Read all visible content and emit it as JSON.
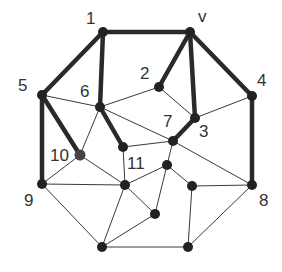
{
  "diagram": {
    "type": "graph",
    "colors": {
      "edge": "#3a3a3a",
      "highlight": "#2a2a2a",
      "node": "#222222",
      "label": "#333333"
    },
    "nodes": [
      {
        "id": "1",
        "x": 103,
        "y": 32,
        "label": "1",
        "lx": 86,
        "ly": 24
      },
      {
        "id": "v",
        "x": 190,
        "y": 32,
        "label": "v",
        "lx": 198,
        "ly": 22
      },
      {
        "id": "5",
        "x": 42,
        "y": 95,
        "label": "5",
        "lx": 18,
        "ly": 91
      },
      {
        "id": "6",
        "x": 100,
        "y": 107,
        "label": "6",
        "lx": 80,
        "ly": 97
      },
      {
        "id": "2",
        "x": 159,
        "y": 87,
        "label": "2",
        "lx": 140,
        "ly": 79
      },
      {
        "id": "4",
        "x": 252,
        "y": 96,
        "label": "4",
        "lx": 257,
        "ly": 86
      },
      {
        "id": "3",
        "x": 195,
        "y": 118,
        "label": "3",
        "lx": 199,
        "ly": 137
      },
      {
        "id": "7",
        "x": 173,
        "y": 141,
        "label": "7",
        "lx": 163,
        "ly": 127
      },
      {
        "id": "10",
        "x": 80,
        "y": 155,
        "label": "10",
        "lx": 50,
        "ly": 161
      },
      {
        "id": "11",
        "x": 123,
        "y": 147,
        "label": "11",
        "lx": 127,
        "ly": 169
      },
      {
        "id": "9",
        "x": 42,
        "y": 184,
        "label": "9",
        "lx": 24,
        "ly": 206
      },
      {
        "id": "a",
        "x": 125,
        "y": 185,
        "label": "",
        "lx": 0,
        "ly": 0
      },
      {
        "id": "b",
        "x": 167,
        "y": 165,
        "label": "",
        "lx": 0,
        "ly": 0
      },
      {
        "id": "c",
        "x": 192,
        "y": 186,
        "label": "",
        "lx": 0,
        "ly": 0
      },
      {
        "id": "8",
        "x": 252,
        "y": 185,
        "label": "8",
        "lx": 259,
        "ly": 206
      },
      {
        "id": "d",
        "x": 155,
        "y": 214,
        "label": "",
        "lx": 0,
        "ly": 0
      },
      {
        "id": "e",
        "x": 102,
        "y": 247,
        "label": "",
        "lx": 0,
        "ly": 0
      },
      {
        "id": "f",
        "x": 188,
        "y": 247,
        "label": "",
        "lx": 0,
        "ly": 0
      }
    ],
    "thick_edges": [
      [
        "1",
        "v"
      ],
      [
        "1",
        "5"
      ],
      [
        "1",
        "6"
      ],
      [
        "v",
        "2"
      ],
      [
        "v",
        "3"
      ],
      [
        "v",
        "4"
      ],
      [
        "5",
        "9"
      ],
      [
        "5",
        "10"
      ],
      [
        "6",
        "11"
      ],
      [
        "3",
        "7"
      ],
      [
        "4",
        "8"
      ]
    ],
    "thin_edges": [
      [
        "5",
        "6"
      ],
      [
        "6",
        "2"
      ],
      [
        "6",
        "7"
      ],
      [
        "6",
        "10"
      ],
      [
        "2",
        "3"
      ],
      [
        "3",
        "4"
      ],
      [
        "7",
        "11"
      ],
      [
        "7",
        "8"
      ],
      [
        "7",
        "b"
      ],
      [
        "10",
        "9"
      ],
      [
        "10",
        "a"
      ],
      [
        "11",
        "a"
      ],
      [
        "9",
        "a"
      ],
      [
        "9",
        "e"
      ],
      [
        "a",
        "b"
      ],
      [
        "a",
        "d"
      ],
      [
        "a",
        "e"
      ],
      [
        "b",
        "c"
      ],
      [
        "b",
        "d"
      ],
      [
        "c",
        "8"
      ],
      [
        "c",
        "f"
      ],
      [
        "8",
        "f"
      ],
      [
        "d",
        "e"
      ],
      [
        "e",
        "f"
      ]
    ]
  }
}
